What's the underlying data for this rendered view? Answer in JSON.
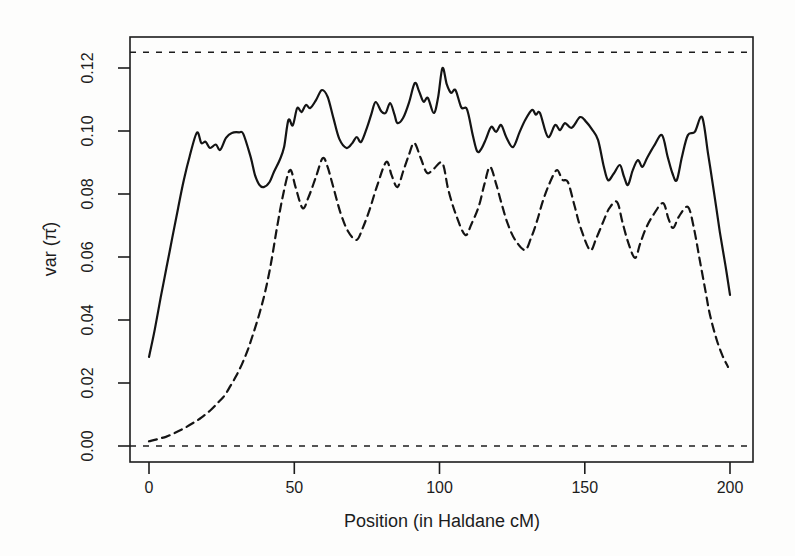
{
  "figure": {
    "background": "#fdfdfc",
    "ink_color": "#1c1c1c"
  },
  "chart_data": {
    "type": "line",
    "title": "",
    "xlabel": "Position (in Haldane cM)",
    "ylabel": "var (π̂)",
    "xlim": [
      -6.5,
      208
    ],
    "ylim": [
      -0.005,
      0.13
    ],
    "x_ticks": [
      0,
      50,
      100,
      150,
      200
    ],
    "x_tick_labels": [
      "0",
      "50",
      "100",
      "150",
      "200"
    ],
    "y_ticks": [
      0,
      0.02,
      0.04,
      0.06,
      0.08,
      0.1,
      0.12
    ],
    "y_tick_labels": [
      "0.00",
      "0.02",
      "0.04",
      "0.06",
      "0.08",
      "0.10",
      "0.12"
    ],
    "grid": false,
    "legend": "none",
    "reference_lines": [
      {
        "name": "upper-bound-line",
        "value": 0.125,
        "style": "dashed"
      },
      {
        "name": "lower-bound-line",
        "value": 0.0,
        "style": "dashed"
      }
    ],
    "series": [
      {
        "name": "solid-curve",
        "style": "solid",
        "points": [
          [
            0,
            0.0283
          ],
          [
            2,
            0.037
          ],
          [
            4,
            0.047
          ],
          [
            6,
            0.0565
          ],
          [
            8,
            0.066
          ],
          [
            10,
            0.0755
          ],
          [
            12,
            0.0845
          ],
          [
            14,
            0.092
          ],
          [
            16.5,
            0.0995
          ],
          [
            18,
            0.0962
          ],
          [
            19.5,
            0.0966
          ],
          [
            21,
            0.0946
          ],
          [
            23,
            0.0957
          ],
          [
            24.5,
            0.094
          ],
          [
            26.5,
            0.0978
          ],
          [
            28.5,
            0.0994
          ],
          [
            31,
            0.0996
          ],
          [
            32.5,
            0.099
          ],
          [
            35,
            0.0917
          ],
          [
            36.5,
            0.086
          ],
          [
            38,
            0.0829
          ],
          [
            39.5,
            0.0822
          ],
          [
            41.5,
            0.0838
          ],
          [
            43,
            0.087
          ],
          [
            45,
            0.0908
          ],
          [
            46.5,
            0.0949
          ],
          [
            48,
            0.1035
          ],
          [
            49.5,
            0.1018
          ],
          [
            51,
            0.1073
          ],
          [
            52.5,
            0.106
          ],
          [
            54,
            0.1083
          ],
          [
            55.5,
            0.1073
          ],
          [
            57.5,
            0.1098
          ],
          [
            59.5,
            0.113
          ],
          [
            61.5,
            0.1108
          ],
          [
            63.5,
            0.104
          ],
          [
            65.5,
            0.0975
          ],
          [
            68,
            0.0946
          ],
          [
            70,
            0.0962
          ],
          [
            71.5,
            0.0981
          ],
          [
            73,
            0.0965
          ],
          [
            75,
            0.101
          ],
          [
            76.5,
            0.1052
          ],
          [
            78,
            0.1092
          ],
          [
            80,
            0.1062
          ],
          [
            81.5,
            0.1058
          ],
          [
            83,
            0.1089
          ],
          [
            84.5,
            0.1052
          ],
          [
            85.5,
            0.1025
          ],
          [
            87.5,
            0.1042
          ],
          [
            89.5,
            0.109
          ],
          [
            91.5,
            0.1152
          ],
          [
            93,
            0.1125
          ],
          [
            94.5,
            0.1093
          ],
          [
            96,
            0.1105
          ],
          [
            98,
            0.1057
          ],
          [
            99.5,
            0.1105
          ],
          [
            101,
            0.12
          ],
          [
            102.5,
            0.1148
          ],
          [
            104,
            0.1121
          ],
          [
            105.5,
            0.113
          ],
          [
            107.5,
            0.1075
          ],
          [
            109.5,
            0.1068
          ],
          [
            111.5,
            0.0985
          ],
          [
            113,
            0.0935
          ],
          [
            114.5,
            0.0945
          ],
          [
            116,
            0.0975
          ],
          [
            117.8,
            0.1013
          ],
          [
            119.5,
            0.0997
          ],
          [
            121.2,
            0.1019
          ],
          [
            123,
            0.098
          ],
          [
            125.3,
            0.0949
          ],
          [
            127.5,
            0.0995
          ],
          [
            129.5,
            0.1035
          ],
          [
            131.8,
            0.1067
          ],
          [
            133.2,
            0.1052
          ],
          [
            134.6,
            0.1057
          ],
          [
            137.3,
            0.0981
          ],
          [
            139.8,
            0.1019
          ],
          [
            141.5,
            0.1003
          ],
          [
            143.2,
            0.1025
          ],
          [
            145.5,
            0.101
          ],
          [
            148.4,
            0.1044
          ],
          [
            150.5,
            0.1029
          ],
          [
            152.5,
            0.1005
          ],
          [
            154.6,
            0.0971
          ],
          [
            156.5,
            0.089
          ],
          [
            158,
            0.0844
          ],
          [
            160,
            0.0865
          ],
          [
            162.1,
            0.0892
          ],
          [
            163.5,
            0.0855
          ],
          [
            164.9,
            0.0829
          ],
          [
            166.5,
            0.0875
          ],
          [
            168.3,
            0.0908
          ],
          [
            169.8,
            0.0886
          ],
          [
            171.5,
            0.0915
          ],
          [
            174,
            0.0955
          ],
          [
            176.6,
            0.0987
          ],
          [
            178.5,
            0.092
          ],
          [
            180.2,
            0.0865
          ],
          [
            181.7,
            0.0844
          ],
          [
            183.5,
            0.092
          ],
          [
            185.5,
            0.0987
          ],
          [
            187.9,
            0.0997
          ],
          [
            190.4,
            0.1044
          ],
          [
            192.5,
            0.0925
          ],
          [
            194.5,
            0.0805
          ],
          [
            196.5,
            0.068
          ],
          [
            198.5,
            0.057
          ],
          [
            200,
            0.048
          ]
        ]
      },
      {
        "name": "dashed-curve",
        "style": "dashed",
        "points": [
          [
            0,
            0.0015
          ],
          [
            3,
            0.0022
          ],
          [
            6,
            0.003
          ],
          [
            9,
            0.0042
          ],
          [
            12,
            0.0056
          ],
          [
            15,
            0.0072
          ],
          [
            18,
            0.009
          ],
          [
            21,
            0.0112
          ],
          [
            24,
            0.014
          ],
          [
            26,
            0.016
          ],
          [
            28,
            0.019
          ],
          [
            30,
            0.0222
          ],
          [
            32,
            0.026
          ],
          [
            34,
            0.0305
          ],
          [
            36,
            0.036
          ],
          [
            38,
            0.042
          ],
          [
            40,
            0.049
          ],
          [
            42,
            0.058
          ],
          [
            44,
            0.069
          ],
          [
            46,
            0.079
          ],
          [
            48.5,
            0.0876
          ],
          [
            50.5,
            0.082
          ],
          [
            52.9,
            0.0755
          ],
          [
            55,
            0.0792
          ],
          [
            57.5,
            0.0855
          ],
          [
            59.8,
            0.0914
          ],
          [
            61.5,
            0.0885
          ],
          [
            63.5,
            0.082
          ],
          [
            66,
            0.0738
          ],
          [
            68.5,
            0.0682
          ],
          [
            71.4,
            0.0654
          ],
          [
            73.5,
            0.069
          ],
          [
            76,
            0.0752
          ],
          [
            78.5,
            0.0825
          ],
          [
            81.7,
            0.0902
          ],
          [
            83.5,
            0.086
          ],
          [
            85.5,
            0.0822
          ],
          [
            87.5,
            0.0872
          ],
          [
            89.5,
            0.0925
          ],
          [
            91.3,
            0.0962
          ],
          [
            93.5,
            0.0915
          ],
          [
            95.7,
            0.0867
          ],
          [
            98,
            0.088
          ],
          [
            101,
            0.0898
          ],
          [
            103,
            0.0815
          ],
          [
            105.5,
            0.0738
          ],
          [
            108.8,
            0.067
          ],
          [
            111,
            0.0705
          ],
          [
            113.5,
            0.076
          ],
          [
            115.5,
            0.0832
          ],
          [
            117.4,
            0.0886
          ],
          [
            119.5,
            0.0832
          ],
          [
            121.5,
            0.0765
          ],
          [
            123.5,
            0.0705
          ],
          [
            126,
            0.0655
          ],
          [
            129.4,
            0.0622
          ],
          [
            131.5,
            0.066
          ],
          [
            133.5,
            0.0712
          ],
          [
            135.5,
            0.0775
          ],
          [
            137.8,
            0.0832
          ],
          [
            140.4,
            0.0876
          ],
          [
            142.3,
            0.0845
          ],
          [
            144.2,
            0.0838
          ],
          [
            146.5,
            0.0762
          ],
          [
            148.5,
            0.0695
          ],
          [
            151.8,
            0.0622
          ],
          [
            154,
            0.066
          ],
          [
            156.5,
            0.0715
          ],
          [
            158.5,
            0.0755
          ],
          [
            161.1,
            0.0775
          ],
          [
            163,
            0.071
          ],
          [
            165,
            0.0645
          ],
          [
            167.3,
            0.0597
          ],
          [
            169,
            0.064
          ],
          [
            171,
            0.069
          ],
          [
            173.5,
            0.0732
          ],
          [
            176.9,
            0.0771
          ],
          [
            178.8,
            0.0722
          ],
          [
            180.4,
            0.0692
          ],
          [
            182.5,
            0.073
          ],
          [
            185.5,
            0.0759
          ],
          [
            187.5,
            0.0695
          ],
          [
            189.5,
            0.0595
          ],
          [
            191.5,
            0.0495
          ],
          [
            193.1,
            0.0416
          ],
          [
            195.5,
            0.0335
          ],
          [
            197.5,
            0.0285
          ],
          [
            199.3,
            0.0251
          ]
        ]
      }
    ]
  }
}
